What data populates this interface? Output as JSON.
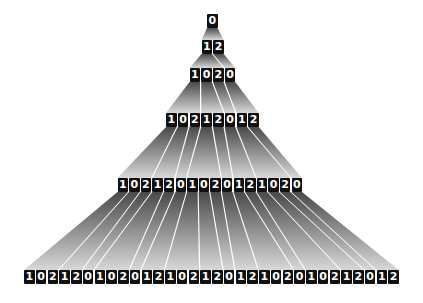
{
  "diagram": {
    "title": "",
    "type": "substitution-tree",
    "rules": {
      "0": "12",
      "1": "102",
      "2": "0"
    },
    "colors": {
      "cell_bg": "#111111",
      "cell_text": "#ffffff",
      "wedge_top": "#4a4a4a",
      "wedge_bottom": "#d8d8d8",
      "background": "#ffffff"
    },
    "rows": [
      {
        "label": "generation-0",
        "digits": "0",
        "x": 207,
        "y": 14,
        "pitch": 11.75,
        "cell_w": 10.5
      },
      {
        "label": "generation-1",
        "digits": "12",
        "x": 201.5,
        "y": 40,
        "pitch": 11.75,
        "cell_w": 10.5
      },
      {
        "label": "generation-2",
        "digits": "1020",
        "x": 189.5,
        "y": 68,
        "pitch": 11.75,
        "cell_w": 10.5
      },
      {
        "label": "generation-3",
        "digits": "10212012",
        "x": 166,
        "y": 113,
        "pitch": 11.75,
        "cell_w": 10.5
      },
      {
        "label": "generation-4",
        "digits": "1021201020121020",
        "x": 117.5,
        "y": 178,
        "pitch": 11.6,
        "cell_w": 10.5
      },
      {
        "label": "generation-5",
        "digits": "10212010201210212012102010212012",
        "x": 24,
        "y": 270,
        "pitch": 11.75,
        "cell_w": 10.5
      }
    ]
  }
}
